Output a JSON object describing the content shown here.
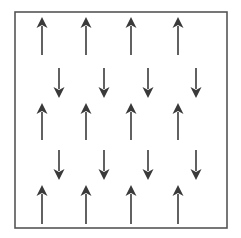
{
  "diagram": {
    "type": "spin-lattice",
    "frame": {
      "x": 15,
      "y": 12,
      "width": 212,
      "height": 216,
      "stroke": "#555555"
    },
    "arrow_color": "#3a3a3a",
    "up_arrows": {
      "columns_x": [
        42,
        86,
        131,
        178
      ],
      "rows": [
        {
          "y_tail": 55,
          "y_head": 17
        },
        {
          "y_tail": 140,
          "y_head": 103
        },
        {
          "y_tail": 224,
          "y_head": 185
        }
      ]
    },
    "down_arrows": {
      "columns_x": [
        59,
        104,
        148,
        196
      ],
      "rows": [
        {
          "y_tail": 68,
          "y_head": 98
        },
        {
          "y_tail": 150,
          "y_head": 180
        }
      ]
    },
    "counts": {
      "up": 12,
      "down": 8,
      "total": 20
    }
  }
}
